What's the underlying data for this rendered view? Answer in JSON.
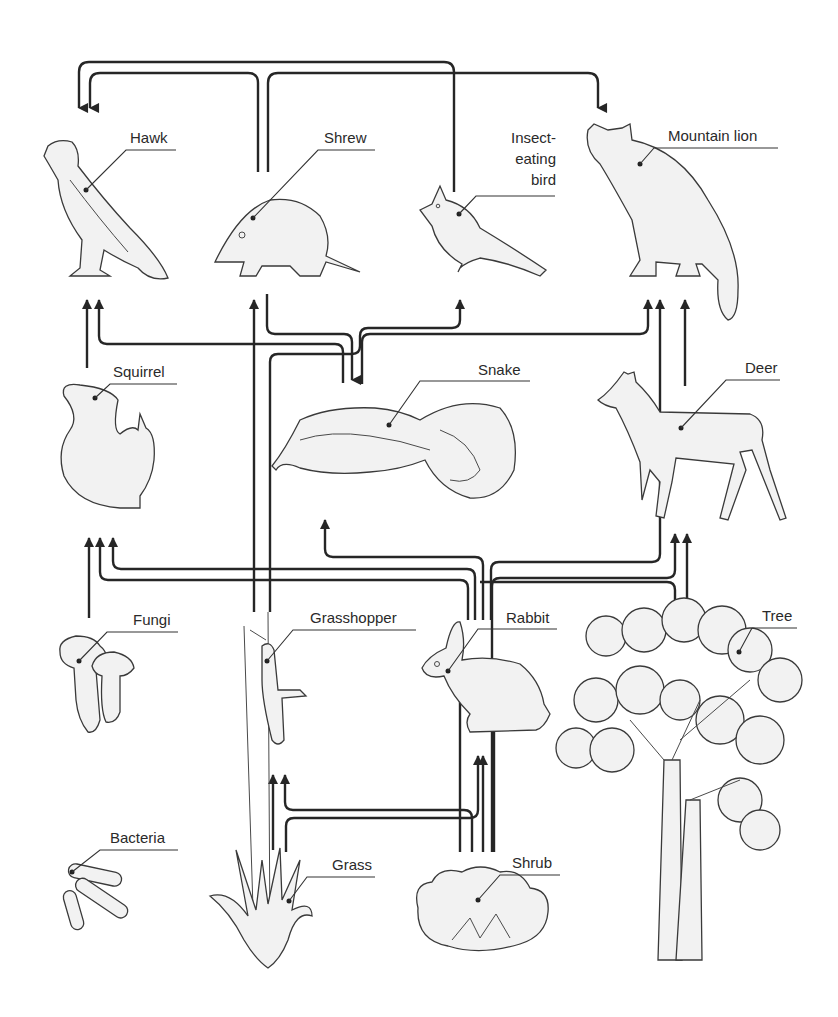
{
  "colors": {
    "arrow": "#262626",
    "organism_fill": "#f2f2f2",
    "organism_stroke": "#3a3a3a",
    "background": "#ffffff"
  },
  "organisms": {
    "hawk": {
      "label": "Hawk",
      "icon": "hawk-icon"
    },
    "shrew": {
      "label": "Shrew",
      "icon": "shrew-icon"
    },
    "insect_bird": {
      "label_line1": "Insect-",
      "label_line2": "eating",
      "label_line3": "bird",
      "icon": "bird-icon"
    },
    "mountain_lion": {
      "label": "Mountain lion",
      "icon": "mountain-lion-icon"
    },
    "squirrel": {
      "label": "Squirrel",
      "icon": "squirrel-icon"
    },
    "snake": {
      "label": "Snake",
      "icon": "snake-icon"
    },
    "deer": {
      "label": "Deer",
      "icon": "deer-icon"
    },
    "fungi": {
      "label": "Fungi",
      "icon": "fungi-icon"
    },
    "grasshopper": {
      "label": "Grasshopper",
      "icon": "grasshopper-icon"
    },
    "rabbit": {
      "label": "Rabbit",
      "icon": "rabbit-icon"
    },
    "tree": {
      "label": "Tree",
      "icon": "tree-icon"
    },
    "bacteria": {
      "label": "Bacteria",
      "icon": "bacteria-icon"
    },
    "grass": {
      "label": "Grass",
      "icon": "grass-icon"
    },
    "shrub": {
      "label": "Shrub",
      "icon": "shrub-icon"
    }
  },
  "links": [
    {
      "from": "Shrew",
      "to": "Hawk"
    },
    {
      "from": "Insect-eating bird",
      "to": "Hawk"
    },
    {
      "from": "Shrew",
      "to": "Mountain lion"
    },
    {
      "from": "Squirrel",
      "to": "Hawk"
    },
    {
      "from": "Snake",
      "to": "Hawk"
    },
    {
      "from": "Shrew",
      "to": "Snake"
    },
    {
      "from": "Grasshopper",
      "to": "Shrew"
    },
    {
      "from": "Grasshopper",
      "to": "Snake"
    },
    {
      "from": "Grasshopper",
      "to": "Insect-eating bird"
    },
    {
      "from": "Deer",
      "to": "Mountain lion"
    },
    {
      "from": "Rabbit",
      "to": "Mountain lion"
    },
    {
      "from": "Rabbit",
      "to": "Snake"
    },
    {
      "from": "Snake",
      "to": "Mountain lion"
    },
    {
      "from": "Fungi",
      "to": "Squirrel"
    },
    {
      "from": "Shrub",
      "to": "Squirrel"
    },
    {
      "from": "Tree",
      "to": "Squirrel"
    },
    {
      "from": "Shrub",
      "to": "Deer"
    },
    {
      "from": "Tree",
      "to": "Deer"
    },
    {
      "from": "Grass",
      "to": "Grasshopper"
    },
    {
      "from": "Shrub",
      "to": "Grasshopper"
    },
    {
      "from": "Grass",
      "to": "Rabbit"
    },
    {
      "from": "Shrub",
      "to": "Rabbit"
    }
  ]
}
